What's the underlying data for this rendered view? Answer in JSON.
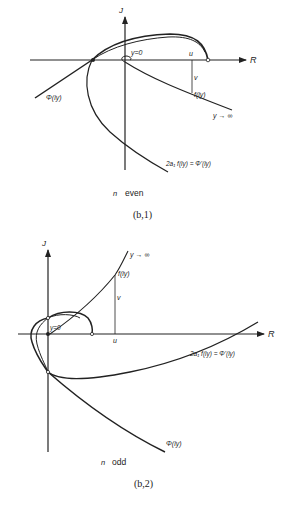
{
  "figure_1": {
    "axis_x_label": "R",
    "axis_y_label": "J",
    "label_y0": "y=0",
    "label_u": "u",
    "label_v": "v",
    "label_f": "f(iy)",
    "label_y_inf": "y → ∞",
    "label_phi": "Φ(iy)",
    "label_deriv": "2a₁ f(iy) = Φ'(iy)",
    "case_n": "n",
    "case_parity": "even",
    "caption": "(b,1)"
  },
  "figure_2": {
    "axis_x_label": "R",
    "axis_y_label": "J",
    "label_y0": "y=0",
    "label_u": "u",
    "label_v": "v",
    "label_f": "f(iy)",
    "label_y_inf": "y → ∞",
    "label_phi": "Φ(iy)",
    "label_deriv": "2a₁ f(iy) = Φ'(iy)",
    "case_n": "n",
    "case_parity": "odd",
    "caption": "(b,2)"
  }
}
